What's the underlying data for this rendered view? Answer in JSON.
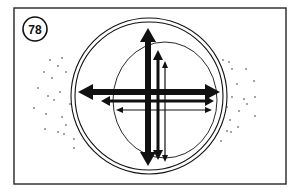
{
  "figure": {
    "number_label": "78"
  },
  "colors": {
    "ink": "#111111",
    "background": "#ffffff",
    "frame": "#333333"
  }
}
